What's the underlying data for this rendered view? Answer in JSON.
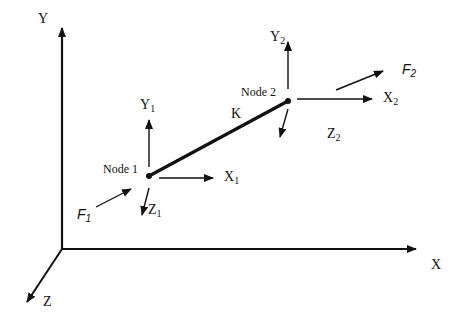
{
  "diagram": {
    "type": "spring-element coordinate diagram",
    "global_axes": {
      "x": {
        "label": "X"
      },
      "y": {
        "label": "Y"
      },
      "z": {
        "label": "Z"
      }
    },
    "element": {
      "label": "K"
    },
    "nodes": [
      {
        "label": "Node 1",
        "axes": {
          "x": {
            "base": "X",
            "sub": "1"
          },
          "y": {
            "base": "Y",
            "sub": "1"
          },
          "z": {
            "base": "Z",
            "sub": "1"
          }
        },
        "force": {
          "base": "F",
          "sub": "1"
        }
      },
      {
        "label": "Node 2",
        "axes": {
          "x": {
            "base": "X",
            "sub": "2"
          },
          "y": {
            "base": "Y",
            "sub": "2"
          },
          "z": {
            "base": "Z",
            "sub": "2"
          }
        },
        "force": {
          "base": "F",
          "sub": "2"
        }
      }
    ],
    "colors": {
      "stroke": "#111111",
      "background": "#ffffff"
    }
  }
}
